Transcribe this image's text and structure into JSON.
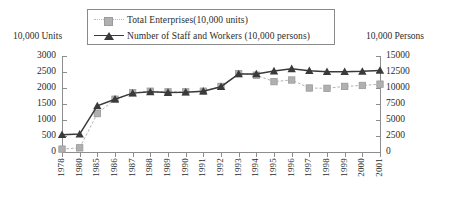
{
  "axis_captions": {
    "left_unit": "10,000 Units",
    "right_unit": "10,000 Persons"
  },
  "legend": {
    "items": [
      {
        "label": "Total  Enterprises(10,000 units)",
        "marker": "square-marker",
        "line": "dashed",
        "color": "#b0b0b0"
      },
      {
        "label": "Number of Staff and Workers (10,000 persons)",
        "marker": "triangle-marker",
        "line": "solid",
        "color": "#3a3a3a"
      }
    ]
  },
  "chart_data": {
    "type": "line",
    "title": "",
    "subtitle": "",
    "xlabel": "",
    "ylabel": "10,000 Units",
    "y2label": "10,000 Persons",
    "grid": false,
    "legend_position": "top-center",
    "categories": [
      "1978",
      "1980",
      "1985",
      "1986",
      "1987",
      "1988",
      "1989",
      "1990",
      "1991",
      "1992",
      "1993",
      "1994",
      "1995",
      "1996",
      "1997",
      "1998",
      "1999",
      "2000",
      "2001"
    ],
    "ylim": [
      0,
      3000
    ],
    "yticks": [
      0,
      500,
      1000,
      1500,
      2000,
      2500,
      3000
    ],
    "y2lim": [
      0,
      15000
    ],
    "y2ticks": [
      0,
      2500,
      5000,
      7500,
      10000,
      12500,
      15000
    ],
    "series": [
      {
        "name": "Total  Enterprises(10,000 units)",
        "axis": "left",
        "marker": "square",
        "linestyle": "dashed",
        "color": "#b0b0b0",
        "values": [
          90,
          130,
          1200,
          1650,
          1850,
          1900,
          1880,
          1880,
          1900,
          2050,
          2450,
          2400,
          2200,
          2250,
          2000,
          1990,
          2050,
          2080,
          2120
        ]
      },
      {
        "name": "Number of Staff and Workers (10,000 persons)",
        "axis": "right",
        "marker": "triangle",
        "linestyle": "solid",
        "color": "#3a3a3a",
        "values": [
          2700,
          2800,
          7200,
          8250,
          9200,
          9400,
          9300,
          9350,
          9500,
          10200,
          12200,
          12200,
          12650,
          13000,
          12700,
          12550,
          12550,
          12600,
          12750
        ]
      }
    ]
  }
}
